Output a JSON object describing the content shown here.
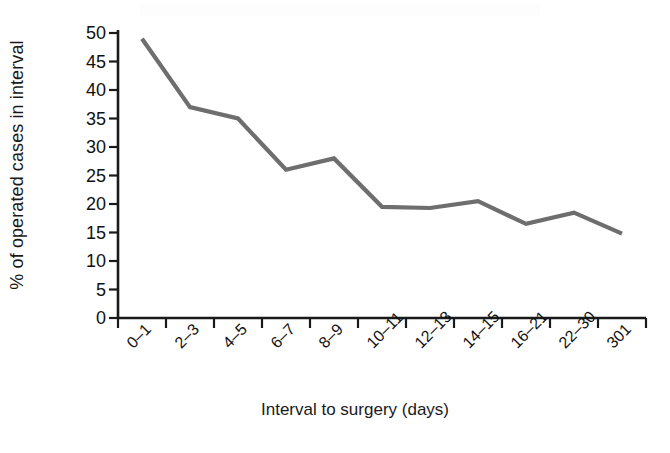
{
  "chart_data": {
    "type": "line",
    "title": "",
    "xlabel": "Interval to surgery (days)",
    "ylabel": "% of operated cases in interval",
    "categories": [
      "0–1",
      "2–3",
      "4–5",
      "6–7",
      "8–9",
      "10–11",
      "12–13",
      "14–15",
      "16–21",
      "22–30",
      "301"
    ],
    "values": [
      49,
      37,
      35,
      26,
      28,
      19.5,
      19.3,
      20.5,
      16.5,
      18.5,
      14.8
    ],
    "ylim": [
      0,
      50
    ],
    "ytick_labels": [
      "50",
      "45",
      "40",
      "35",
      "30",
      "25",
      "20",
      "15",
      "10",
      "5",
      "0"
    ],
    "ytick_values": [
      50,
      45,
      40,
      35,
      30,
      25,
      20,
      15,
      10,
      5,
      0
    ],
    "grid": false,
    "legend": "none",
    "series_color": "#6e6e6e",
    "axis_color": "#1a1a1a"
  }
}
